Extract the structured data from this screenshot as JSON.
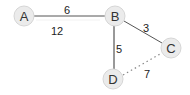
{
  "diagram": {
    "type": "weighted-graph",
    "colors": {
      "node_fill": "#ebebeb",
      "node_stroke": "#d4d4d4",
      "edge_solid": "#444444",
      "edge_dotted": "#888888",
      "text": "#333333"
    },
    "nodes": [
      {
        "id": "A",
        "label": "A",
        "x": 24,
        "y": 16
      },
      {
        "id": "B",
        "label": "B",
        "x": 115,
        "y": 16
      },
      {
        "id": "C",
        "label": "C",
        "x": 171,
        "y": 48
      },
      {
        "id": "D",
        "label": "D",
        "x": 113,
        "y": 79
      }
    ],
    "edges": [
      {
        "from": "A",
        "to": "B",
        "weight_label": "6",
        "style": "solid"
      },
      {
        "from": "B",
        "to": "C",
        "weight_label": "3",
        "style": "solid"
      },
      {
        "from": "B",
        "to": "D",
        "weight_label": "5",
        "style": "solid"
      },
      {
        "from": "D",
        "to": "C",
        "weight_label": "7",
        "style": "dotted"
      }
    ],
    "annotations": [
      {
        "text": "12",
        "x": 57,
        "y": 35
      }
    ]
  }
}
